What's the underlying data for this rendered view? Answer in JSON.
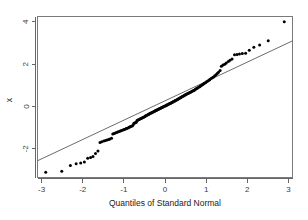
{
  "chart_data": {
    "type": "scatter",
    "title": "",
    "subtitle": "",
    "xlabel": "Quantiles of Standard Normal",
    "ylabel": "x",
    "xlim": [
      -3.1,
      3.1
    ],
    "ylim": [
      -3.35,
      4.25
    ],
    "grid": false,
    "legend": "none",
    "x_ticks": [
      -3,
      -2,
      -1,
      0,
      1,
      2,
      3
    ],
    "x_tick_labels": [
      "-3",
      "-2",
      "-1",
      "0",
      "1",
      "2",
      "3"
    ],
    "y_ticks": [
      -2,
      0,
      2,
      4
    ],
    "y_tick_labels": [
      "-2",
      "0",
      "2",
      "4"
    ],
    "point_color": "#000000",
    "line_color": "#5a5a5a",
    "box_color": "#7a7a7a",
    "background_color": "#ffffff",
    "reference_line": {
      "name": "qq-line",
      "x1": -3.1,
      "y1": -2.56,
      "x2": 3.1,
      "y2": 3.1
    },
    "series": [
      {
        "name": "sample-quantiles",
        "marker": "dot",
        "x": [
          -2.9,
          -2.51,
          -2.3,
          -2.16,
          -2.05,
          -1.96,
          -1.88,
          -1.81,
          -1.75,
          -1.69,
          -1.63,
          -1.58,
          -1.54,
          -1.49,
          -1.45,
          -1.41,
          -1.37,
          -1.34,
          -1.3,
          -1.27,
          -1.24,
          -1.21,
          -1.18,
          -1.15,
          -1.12,
          -1.09,
          -1.07,
          -1.04,
          -1.01,
          -0.99,
          -0.96,
          -0.94,
          -0.92,
          -0.89,
          -0.87,
          -0.85,
          -0.83,
          -0.8,
          -0.78,
          -0.76,
          -0.74,
          -0.72,
          -0.7,
          -0.68,
          -0.66,
          -0.64,
          -0.62,
          -0.6,
          -0.58,
          -0.56,
          -0.54,
          -0.52,
          -0.5,
          -0.48,
          -0.47,
          -0.45,
          -0.43,
          -0.41,
          -0.39,
          -0.38,
          -0.36,
          -0.34,
          -0.32,
          -0.31,
          -0.29,
          -0.27,
          -0.25,
          -0.24,
          -0.22,
          -0.2,
          -0.19,
          -0.17,
          -0.15,
          -0.14,
          -0.12,
          -0.1,
          -0.09,
          -0.07,
          -0.05,
          -0.04,
          -0.02,
          0.0,
          0.02,
          0.04,
          0.05,
          0.07,
          0.09,
          0.1,
          0.12,
          0.14,
          0.15,
          0.17,
          0.19,
          0.2,
          0.22,
          0.24,
          0.25,
          0.27,
          0.29,
          0.31,
          0.32,
          0.34,
          0.36,
          0.38,
          0.39,
          0.41,
          0.43,
          0.45,
          0.47,
          0.48,
          0.5,
          0.52,
          0.54,
          0.56,
          0.58,
          0.6,
          0.62,
          0.64,
          0.66,
          0.68,
          0.7,
          0.72,
          0.74,
          0.76,
          0.78,
          0.8,
          0.83,
          0.85,
          0.87,
          0.89,
          0.92,
          0.94,
          0.96,
          0.99,
          1.01,
          1.04,
          1.07,
          1.09,
          1.12,
          1.15,
          1.18,
          1.21,
          1.24,
          1.27,
          1.3,
          1.34,
          1.37,
          1.41,
          1.45,
          1.49,
          1.54,
          1.58,
          1.63,
          1.69,
          1.75,
          1.81,
          1.88,
          1.96,
          2.05,
          2.16,
          2.3,
          2.51,
          2.9
        ],
        "y": [
          -3.1,
          -3.05,
          -2.78,
          -2.7,
          -2.66,
          -2.62,
          -2.44,
          -2.4,
          -2.36,
          -2.22,
          -2.1,
          -1.7,
          -1.66,
          -1.63,
          -1.6,
          -1.58,
          -1.56,
          -1.53,
          -1.5,
          -1.3,
          -1.27,
          -1.25,
          -1.22,
          -1.2,
          -1.18,
          -1.16,
          -1.14,
          -1.12,
          -1.1,
          -1.08,
          -1.06,
          -1.04,
          -1.02,
          -1.0,
          -0.98,
          -0.96,
          -0.94,
          -0.92,
          -0.88,
          -0.8,
          -0.78,
          -0.76,
          -0.74,
          -0.66,
          -0.64,
          -0.62,
          -0.6,
          -0.58,
          -0.56,
          -0.54,
          -0.52,
          -0.5,
          -0.48,
          -0.46,
          -0.44,
          -0.42,
          -0.4,
          -0.38,
          -0.36,
          -0.34,
          -0.32,
          -0.3,
          -0.29,
          -0.28,
          -0.26,
          -0.24,
          -0.22,
          -0.2,
          -0.18,
          -0.17,
          -0.15,
          -0.14,
          -0.12,
          -0.1,
          -0.09,
          -0.07,
          -0.06,
          -0.04,
          -0.02,
          -0.01,
          0.01,
          0.03,
          0.04,
          0.06,
          0.08,
          0.09,
          0.11,
          0.13,
          0.14,
          0.16,
          0.18,
          0.19,
          0.21,
          0.23,
          0.25,
          0.26,
          0.28,
          0.3,
          0.32,
          0.34,
          0.36,
          0.38,
          0.4,
          0.42,
          0.44,
          0.46,
          0.48,
          0.5,
          0.52,
          0.54,
          0.56,
          0.58,
          0.6,
          0.62,
          0.64,
          0.66,
          0.68,
          0.7,
          0.72,
          0.74,
          0.76,
          0.78,
          0.81,
          0.84,
          0.86,
          0.89,
          0.92,
          0.95,
          0.98,
          1.01,
          1.04,
          1.07,
          1.1,
          1.13,
          1.17,
          1.2,
          1.24,
          1.28,
          1.32,
          1.36,
          1.4,
          1.45,
          1.5,
          1.56,
          1.62,
          1.7,
          1.9,
          1.96,
          2.0,
          2.06,
          2.12,
          2.18,
          2.24,
          2.44,
          2.46,
          2.48,
          2.5,
          2.52,
          2.66,
          2.8,
          2.9,
          3.1,
          4.0
        ]
      }
    ]
  },
  "axes": {
    "x_axis_name": "Quantiles of Standard Normal",
    "y_axis_name": "x"
  }
}
